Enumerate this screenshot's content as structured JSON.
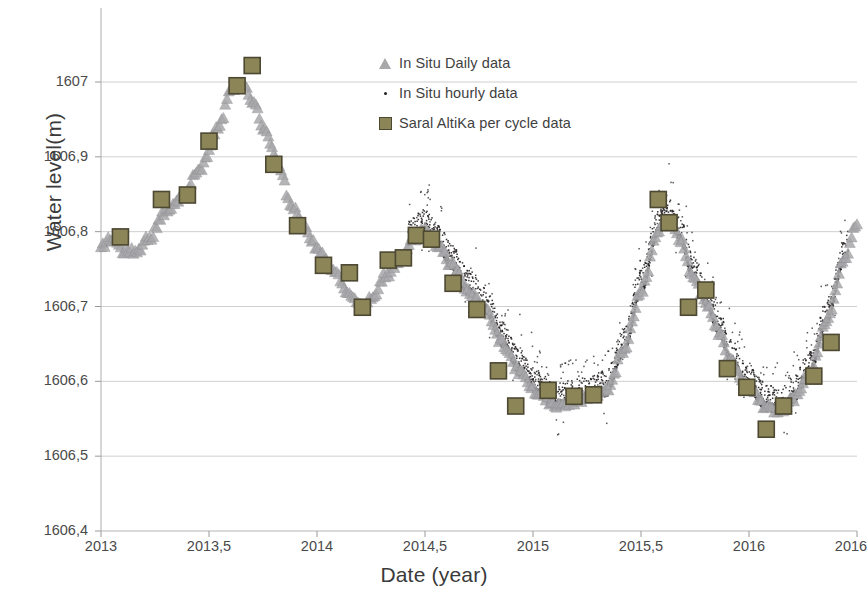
{
  "chart_data": {
    "type": "scatter",
    "title": "",
    "xlabel": "Date (year)",
    "ylabel": "Water level(m)",
    "xlim": [
      2013.0,
      2016.5
    ],
    "ylim": [
      1606.4,
      1607.0
    ],
    "xticks": [
      "2013",
      "2013,5",
      "2014",
      "2014,5",
      "2015",
      "2015,5",
      "2016",
      "2016,5"
    ],
    "xtick_values": [
      2013,
      2013.5,
      2014,
      2014.5,
      2015,
      2015.5,
      2016,
      2016.5
    ],
    "yticks": [
      "1606,4",
      "1606,5",
      "1606,6",
      "1606,7",
      "1606,8",
      "1606,9",
      "1607"
    ],
    "ytick_values": [
      1606.4,
      1606.5,
      1606.6,
      1606.7,
      1606.8,
      1606.9,
      1607.0
    ],
    "grid": "horizontal",
    "legend_position": "top-center",
    "series": [
      {
        "name": "In Situ Daily data",
        "marker": "triangle",
        "color": "#a8a8ab",
        "anchors": [
          [
            2013.0,
            1606.78
          ],
          [
            2013.05,
            1606.79
          ],
          [
            2013.1,
            1606.775
          ],
          [
            2013.16,
            1606.772
          ],
          [
            2013.22,
            1606.79
          ],
          [
            2013.3,
            1606.825
          ],
          [
            2013.38,
            1606.848
          ],
          [
            2013.46,
            1606.885
          ],
          [
            2013.54,
            1606.935
          ],
          [
            2013.6,
            1606.985
          ],
          [
            2013.65,
            1607.0
          ],
          [
            2013.7,
            1606.975
          ],
          [
            2013.76,
            1606.935
          ],
          [
            2013.82,
            1606.89
          ],
          [
            2013.88,
            1606.835
          ],
          [
            2013.94,
            1606.805
          ],
          [
            2014.0,
            1606.778
          ],
          [
            2014.07,
            1606.75
          ],
          [
            2014.14,
            1606.722
          ],
          [
            2014.2,
            1606.7
          ],
          [
            2014.26,
            1606.712
          ],
          [
            2014.32,
            1606.742
          ],
          [
            2014.38,
            1606.76
          ],
          [
            2014.44,
            1606.79
          ],
          [
            2014.5,
            1606.8
          ],
          [
            2014.56,
            1606.782
          ],
          [
            2014.62,
            1606.755
          ],
          [
            2014.7,
            1606.72
          ],
          [
            2014.78,
            1606.695
          ],
          [
            2014.86,
            1606.65
          ],
          [
            2014.94,
            1606.612
          ],
          [
            2015.02,
            1606.585
          ],
          [
            2015.1,
            1606.567
          ],
          [
            2015.18,
            1606.572
          ],
          [
            2015.26,
            1606.578
          ],
          [
            2015.34,
            1606.585
          ],
          [
            2015.42,
            1606.64
          ],
          [
            2015.5,
            1606.72
          ],
          [
            2015.58,
            1606.8
          ],
          [
            2015.63,
            1606.815
          ],
          [
            2015.68,
            1606.79
          ],
          [
            2015.74,
            1606.74
          ],
          [
            2015.8,
            1606.705
          ],
          [
            2015.86,
            1606.665
          ],
          [
            2015.92,
            1606.625
          ],
          [
            2016.0,
            1606.59
          ],
          [
            2016.08,
            1606.566
          ],
          [
            2016.14,
            1606.56
          ],
          [
            2016.2,
            1606.575
          ],
          [
            2016.28,
            1606.61
          ],
          [
            2016.36,
            1606.68
          ],
          [
            2016.44,
            1606.76
          ],
          [
            2016.5,
            1606.812
          ]
        ]
      },
      {
        "name": "In Situ hourly data",
        "marker": "dot",
        "color": "#231f20",
        "start_x": 2014.42,
        "end_x": 2016.46,
        "note": "dense noisy hourly cloud following daily curve, spiky upward excursions"
      },
      {
        "name": "Saral AltiKa per cycle data",
        "marker": "square",
        "color": "#8b8558",
        "edge_color": "#4c4832",
        "points": [
          [
            2013.09,
            1606.793
          ],
          [
            2013.28,
            1606.843
          ],
          [
            2013.4,
            1606.849
          ],
          [
            2013.5,
            1606.921
          ],
          [
            2013.63,
            1606.995
          ],
          [
            2013.7,
            1607.022
          ],
          [
            2013.8,
            1606.89
          ],
          [
            2013.91,
            1606.808
          ],
          [
            2014.03,
            1606.755
          ],
          [
            2014.15,
            1606.745
          ],
          [
            2014.21,
            1606.699
          ],
          [
            2014.33,
            1606.762
          ],
          [
            2014.4,
            1606.765
          ],
          [
            2014.46,
            1606.795
          ],
          [
            2014.53,
            1606.79
          ],
          [
            2014.63,
            1606.731
          ],
          [
            2014.74,
            1606.696
          ],
          [
            2014.84,
            1606.614
          ],
          [
            2014.92,
            1606.567
          ],
          [
            2015.07,
            1606.588
          ],
          [
            2015.19,
            1606.58
          ],
          [
            2015.28,
            1606.582
          ],
          [
            2015.58,
            1606.843
          ],
          [
            2015.63,
            1606.812
          ],
          [
            2015.72,
            1606.699
          ],
          [
            2015.8,
            1606.722
          ],
          [
            2015.9,
            1606.617
          ],
          [
            2015.99,
            1606.592
          ],
          [
            2016.08,
            1606.536
          ],
          [
            2016.16,
            1606.567
          ],
          [
            2016.3,
            1606.607
          ],
          [
            2016.38,
            1606.652
          ]
        ]
      }
    ]
  },
  "legend": {
    "items": [
      {
        "label": "In Situ Daily data",
        "marker": "triangle-marker"
      },
      {
        "label": "In Situ hourly data",
        "marker": "dot-marker"
      },
      {
        "label": "Saral AltiKa per cycle data",
        "marker": "square-marker"
      }
    ]
  },
  "axes": {
    "y_title": "Water level(m)",
    "x_title": "Date (year)"
  }
}
